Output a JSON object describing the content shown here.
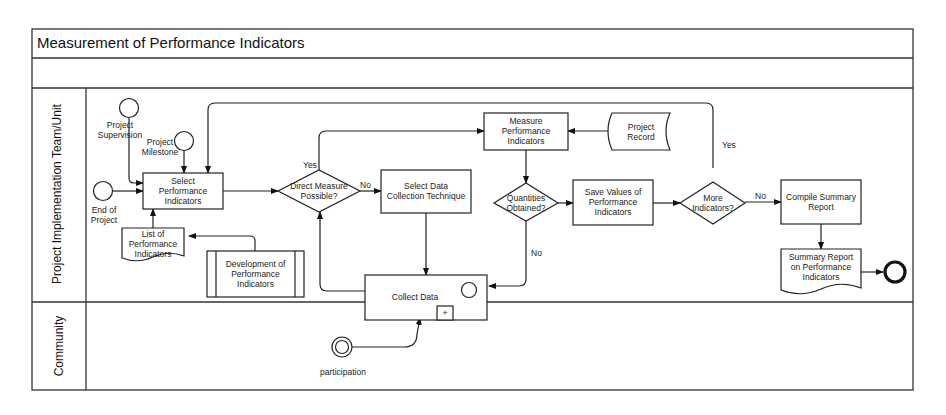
{
  "diagram": {
    "title": "Measurement of Performance Indicators",
    "lanes": [
      {
        "label": "Project Implementation Team/Unit"
      },
      {
        "label": "Community"
      }
    ],
    "events": {
      "project_supervision": "Project\nSupervision",
      "project_milestone": "Project\nMilestone",
      "end_of_project": "End of\nProject",
      "participation": "participation"
    },
    "tasks": {
      "select_performance_indicators": "Select\nPerformance\nIndicators",
      "select_data_collection": "Select Data\nCollection Technique",
      "measure_performance_indicators": "Measure\nPerformance\nIndicators",
      "save_values": "Save Values of\nPerformance\nIndicators",
      "compile_summary": "Compile Summary\nReport",
      "collect_data": "Collect Data",
      "collect_data_marker": "+",
      "development_of_indicators": "Development of\nPerformance\nIndicators"
    },
    "gateways": {
      "direct_measure": "Direct Measure\nPossible?",
      "quantities_obtained": "Quantities\nObtained?",
      "more_indicators": "More\nIndicators?"
    },
    "documents": {
      "list_of_indicators": "List of\nPerformance\nIndicators",
      "project_record": "Project\nRecord",
      "summary_report": "Summary Report\non Performance\nIndicators"
    },
    "edge_labels": {
      "direct_yes": "Yes",
      "direct_no": "No",
      "quantities_no": "No",
      "more_yes": "Yes",
      "more_no": "No"
    }
  }
}
